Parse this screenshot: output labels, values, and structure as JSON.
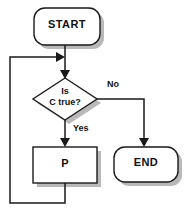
{
  "diagram": {
    "type": "flowchart",
    "background_color": "#ffffff",
    "line_color": "#1a1a1a",
    "shadow_color": "#b9b9b9",
    "nodes": [
      {
        "id": "start",
        "shape": "rounded-rectangle",
        "label": "START",
        "x": 34,
        "y": 8,
        "width": 66,
        "height": 37
      },
      {
        "id": "decision",
        "shape": "diamond",
        "label_line1": "Is",
        "label_line2": "C true?",
        "x": 33,
        "y": 78,
        "width": 64,
        "height": 42
      },
      {
        "id": "process",
        "shape": "rectangle",
        "label": "P",
        "x": 33,
        "y": 147,
        "width": 64,
        "height": 36
      },
      {
        "id": "end",
        "shape": "rounded-rectangle",
        "label": "END",
        "x": 114,
        "y": 147,
        "width": 64,
        "height": 35
      }
    ],
    "edges": [
      {
        "id": "start-to-decision",
        "from": "start",
        "to": "decision",
        "label": ""
      },
      {
        "id": "decision-to-end",
        "from": "decision",
        "to": "end",
        "label": "No"
      },
      {
        "id": "decision-to-process",
        "from": "decision",
        "to": "process",
        "label": "Yes"
      },
      {
        "id": "process-loop-back",
        "from": "process",
        "to": "decision",
        "label": ""
      }
    ]
  }
}
